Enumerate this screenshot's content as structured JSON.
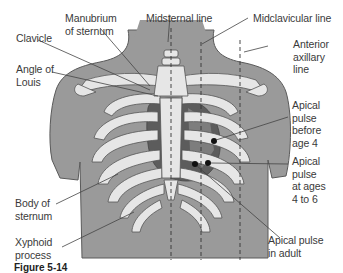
{
  "figure": {
    "type": "anatomical-diagram",
    "colors": {
      "background": "#ffffff",
      "torso": "#9a9a9a",
      "torso_outline": "#5a5a5a",
      "bone": "#e6e6e6",
      "bone_outline": "#555555",
      "heart_dark": "#5c5c5c",
      "heart_mid": "#7d7d7d",
      "intercostal": "#8c8c8c",
      "text": "#3a3a3a",
      "leader_line": "#444444",
      "pulse_dot": "#111111"
    },
    "labels": {
      "manubrium": "Manubrium\nof sternum",
      "midsternal": "Midsternal line",
      "midclavicular": "Midclavicular line",
      "clavicle": "Clavicle",
      "anterior_axillary": "Anterior\naxillary\nline",
      "angle_of_louis": "Angle of\nLouis",
      "apical_before_4": "Apical\npulse\nbefore\nage 4",
      "apical_4_to_6": "Apical\npulse\nat ages\n4 to 6",
      "body_of_sternum": "Body of\nsternum",
      "xyphoid": "Xyphoid\nprocess",
      "apical_adult": "Apical pulse\nin adult"
    },
    "caption": "Figure 5-14"
  }
}
